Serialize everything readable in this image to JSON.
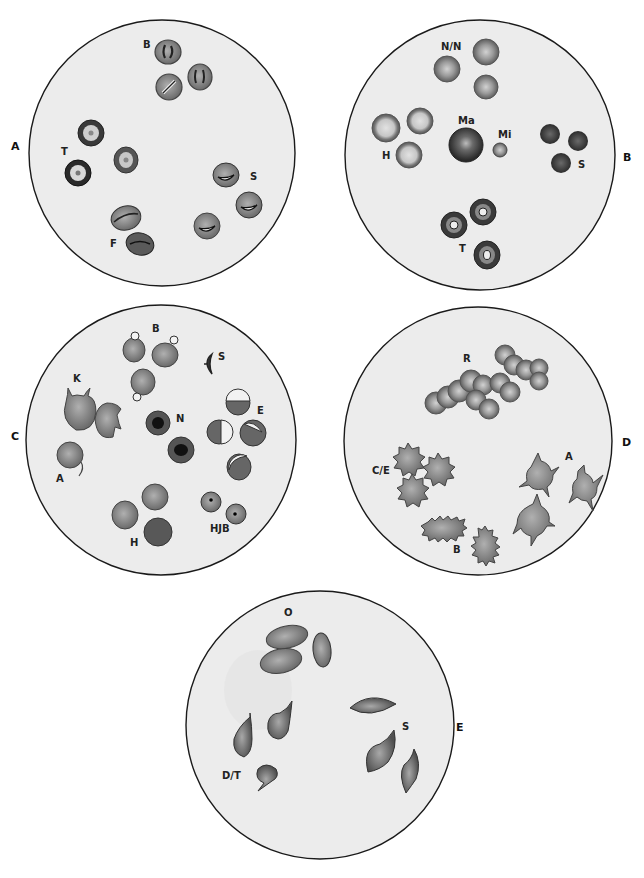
{
  "figure": {
    "colors": {
      "field_fill": "#ececec",
      "field_stroke": "#1a1a1a",
      "cell_mid": "#8a8a8a",
      "cell_dark": "#4a4a4a",
      "cell_light": "#c8c8c8",
      "nucleus": "#111111",
      "pale_center": "#e8e8e8"
    }
  },
  "panels": [
    {
      "id": "A",
      "label": "A",
      "center": [
        162,
        153
      ],
      "radius": 133,
      "label_pos": [
        11,
        147
      ],
      "groups": [
        {
          "code": "B",
          "label": "B",
          "label_pos": [
            143,
            48
          ],
          "cell_type": "inclusion-bar cells"
        },
        {
          "code": "T",
          "label": "T",
          "label_pos": [
            61,
            155
          ],
          "cell_type": "target cells"
        },
        {
          "code": "S",
          "label": "S",
          "label_pos": [
            250,
            180
          ],
          "cell_type": "crescent-inclusion cells"
        },
        {
          "code": "F",
          "label": "F",
          "label_pos": [
            110,
            247
          ],
          "cell_type": "folded cells"
        }
      ]
    },
    {
      "id": "B",
      "label": "B",
      "center": [
        480,
        155
      ],
      "radius": 135,
      "label_pos": [
        623,
        158
      ],
      "groups": [
        {
          "code": "N/N",
          "label": "N/N",
          "label_pos": [
            441,
            50
          ],
          "cell_type": "normocytic normochromic"
        },
        {
          "code": "H",
          "label": "H",
          "label_pos": [
            382,
            159
          ],
          "cell_type": "hypochromic"
        },
        {
          "code": "Ma",
          "label": "Ma",
          "label_pos": [
            458,
            124
          ],
          "cell_type": "macrocyte"
        },
        {
          "code": "Mi",
          "label": "Mi",
          "label_pos": [
            498,
            138
          ],
          "cell_type": "microcyte"
        },
        {
          "code": "S",
          "label": "S",
          "label_pos": [
            578,
            168
          ],
          "cell_type": "spherocytes"
        },
        {
          "code": "T",
          "label": "T",
          "label_pos": [
            459,
            252
          ],
          "cell_type": "target cells"
        }
      ]
    },
    {
      "id": "C",
      "label": "C",
      "center": [
        161,
        440
      ],
      "radius": 135,
      "label_pos": [
        11,
        437
      ],
      "groups": [
        {
          "code": "B",
          "label": "B",
          "label_pos": [
            152,
            332
          ],
          "cell_type": "blister cells"
        },
        {
          "code": "S",
          "label": "S",
          "label_pos": [
            218,
            360
          ],
          "cell_type": "sickle fragment"
        },
        {
          "code": "K",
          "label": "K",
          "label_pos": [
            73,
            382
          ],
          "cell_type": "keratocytes"
        },
        {
          "code": "N",
          "label": "N",
          "label_pos": [
            176,
            422
          ],
          "cell_type": "nucleated RBCs"
        },
        {
          "code": "E",
          "label": "E",
          "label_pos": [
            257,
            414
          ],
          "cell_type": "eccentrocytes"
        },
        {
          "code": "A",
          "label": "A",
          "label_pos": [
            56,
            482
          ],
          "cell_type": "acanthocyte-like"
        },
        {
          "code": "H",
          "label": "H",
          "label_pos": [
            130,
            546
          ],
          "cell_type": "Heinz-body cells"
        },
        {
          "code": "HJB",
          "label": "HJB",
          "label_pos": [
            210,
            532
          ],
          "cell_type": "Howell-Jolly bodies"
        }
      ]
    },
    {
      "id": "D",
      "label": "D",
      "center": [
        478,
        441
      ],
      "radius": 134,
      "label_pos": [
        622,
        443
      ],
      "groups": [
        {
          "code": "R",
          "label": "R",
          "label_pos": [
            463,
            362
          ],
          "cell_type": "rouleaux"
        },
        {
          "code": "C/E",
          "label": "C/E",
          "label_pos": [
            372,
            474
          ],
          "cell_type": "crenated / echinocytes"
        },
        {
          "code": "A",
          "label": "A",
          "label_pos": [
            565,
            460
          ],
          "cell_type": "acanthocytes"
        },
        {
          "code": "B",
          "label": "B",
          "label_pos": [
            453,
            553
          ],
          "cell_type": "burr cells"
        }
      ]
    },
    {
      "id": "E",
      "label": "E",
      "center": [
        320,
        725
      ],
      "radius": 134,
      "label_pos": [
        456,
        728
      ],
      "groups": [
        {
          "code": "O",
          "label": "O",
          "label_pos": [
            284,
            616
          ],
          "cell_type": "ovalocytes"
        },
        {
          "code": "S",
          "label": "S",
          "label_pos": [
            402,
            730
          ],
          "cell_type": "spindle cells"
        },
        {
          "code": "D/T",
          "label": "D/T",
          "label_pos": [
            222,
            779
          ],
          "cell_type": "dacrocytes / teardrops"
        }
      ]
    }
  ]
}
